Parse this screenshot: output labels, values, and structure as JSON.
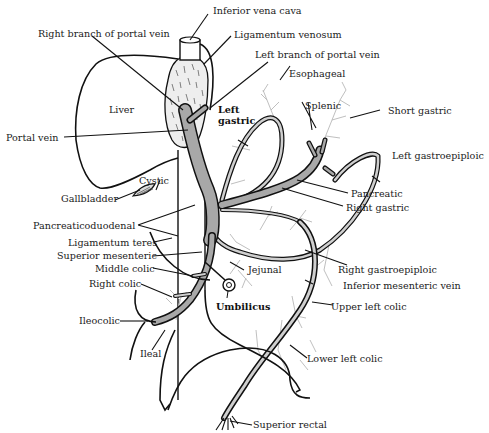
{
  "diagram": {
    "colors": {
      "vessel_fill": "#a8a8a8",
      "outline": "#111111",
      "twig": "#b8b8b8",
      "background": "#ffffff"
    },
    "labels": {
      "inferior_vena_cava": "Inferior vena cava",
      "ligamentum_venosum": "Ligamentum venosum",
      "right_branch_portal": "Right branch of portal vein",
      "left_branch_portal": "Left branch of portal vein",
      "esophageal": "Esophageal",
      "liver": "Liver",
      "left_gastric_1": "Left",
      "left_gastric_2": "gastric",
      "splenic": "Splenic",
      "short_gastric": "Short gastric",
      "portal_vein": "Portal vein",
      "left_gastroepiploic": "Left gastroepiploic",
      "cystic": "Cystic",
      "gallbladder": "Gallbladder",
      "pancreatic": "Pancreatic",
      "right_gastric": "Right gastric",
      "pancreaticoduodenal": "Pancreaticoduodenal",
      "ligamentum_teres": "Ligamentum teres",
      "superior_mesenteric": "Superior mesenteric",
      "jejunal": "Jejunal",
      "right_gastroepiploic": "Right gastroepiploic",
      "middle_colic": "Middle colic",
      "inferior_mesenteric_vein": "Inferior mesenteric vein",
      "right_colic": "Right colic",
      "umbilicus": "Umbilicus",
      "upper_left_colic": "Upper left colic",
      "ileocolic": "Ileocolic",
      "ileal": "Ileal",
      "lower_left_colic": "Lower left colic",
      "superior_rectal": "Superior rectal"
    }
  }
}
